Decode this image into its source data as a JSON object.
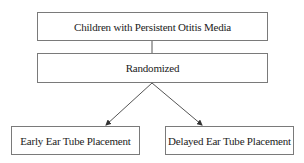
{
  "diagram": {
    "type": "flowchart",
    "nodes": [
      {
        "id": "population",
        "label": "Children with Persistent Otitis Media"
      },
      {
        "id": "randomized",
        "label": "Randomized"
      },
      {
        "id": "early",
        "label": "Early Ear Tube Placement"
      },
      {
        "id": "delayed",
        "label": "Delayed Ear Tube Placement"
      }
    ],
    "edges": [
      {
        "from": "population",
        "to": "randomized",
        "style": "line"
      },
      {
        "from": "randomized",
        "to": "early",
        "style": "arrow"
      },
      {
        "from": "randomized",
        "to": "delayed",
        "style": "arrow"
      }
    ],
    "colors": {
      "border": "#7a7a7a",
      "line": "#555555",
      "text": "#222222"
    }
  }
}
